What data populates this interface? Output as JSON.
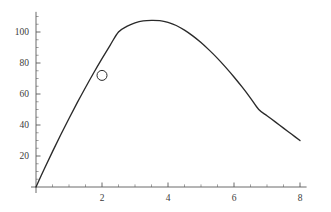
{
  "chart_data": {
    "type": "line",
    "title": "",
    "subtitle": "",
    "xlabel": "",
    "ylabel": "",
    "xlim": [
      -0.15,
      8.2
    ],
    "ylim": [
      -6,
      113
    ],
    "grid": false,
    "legend": null,
    "x_ticks_major": [
      2,
      4,
      6,
      8
    ],
    "x_tick_labels": [
      "2",
      "4",
      "6",
      "8"
    ],
    "x_ticks_minor": [
      0.5,
      1,
      1.5,
      2.5,
      3,
      3.5,
      4.5,
      5,
      5.5,
      6.5,
      7,
      7.5
    ],
    "y_ticks_major": [
      20,
      40,
      60,
      80,
      100
    ],
    "y_tick_labels": [
      "20",
      "40",
      "60",
      "80",
      "100"
    ],
    "y_ticks_minor": [
      5,
      10,
      15,
      25,
      30,
      35,
      45,
      50,
      55,
      65,
      70,
      75,
      85,
      90,
      95,
      105,
      110
    ],
    "series": [
      {
        "name": "trajectory",
        "color": "#2a2a2a",
        "x": [
          0.0,
          0.25,
          0.5,
          0.75,
          1.0,
          1.25,
          1.5,
          1.75,
          2.0,
          2.25,
          2.5,
          2.75,
          3.0,
          3.25,
          3.5,
          3.75,
          4.0,
          4.25,
          4.5,
          4.75,
          5.0,
          5.25,
          5.5,
          5.75,
          6.0,
          6.25,
          6.5,
          6.75,
          7.0,
          7.25,
          7.5,
          7.75,
          8.0
        ],
        "y": [
          0.0,
          11.6,
          22.8,
          33.7,
          44.2,
          54.4,
          64.2,
          73.7,
          82.8,
          91.6,
          100.0,
          103.6,
          105.9,
          107.2,
          107.5,
          107.3,
          106.2,
          104.2,
          101.2,
          97.5,
          93.2,
          88.3,
          83.0,
          77.2,
          71.0,
          64.4,
          57.4,
          50.0,
          46.0,
          42.0,
          38.0,
          34.0,
          30.0
        ]
      }
    ],
    "markers": [
      {
        "name": "highlighted-point",
        "shape": "open-circle",
        "x": 2.0,
        "y": 72.0,
        "radius_px": 5.0,
        "color": "#2a2a2a"
      }
    ],
    "axes": {
      "origin_x_value": 0,
      "origin_y_value": 0,
      "x_axis_color": "#5a5a5a",
      "y_axis_color": "#5a5a5a"
    }
  },
  "figure": {
    "background": "#ffffff",
    "curve_color": "#2a2a2a",
    "axis_color": "#5a5a5a",
    "label_color": "#3b3b3b"
  }
}
